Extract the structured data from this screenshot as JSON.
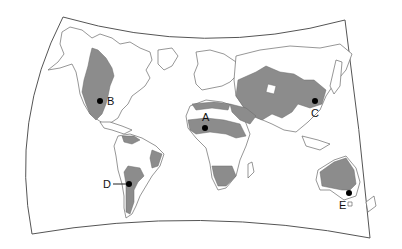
{
  "map": {
    "title": "",
    "projection": "world-map",
    "shading": {
      "meaning": "highlighted climate/biome regions",
      "fill_color": "#8c8c8c",
      "land_color": "#ffffff",
      "outline_color": "#6a6a6a"
    },
    "markers": [
      {
        "id": "A",
        "label": "A",
        "location": "Sahel, North Africa"
      },
      {
        "id": "B",
        "label": "B",
        "location": "Great Plains, North America"
      },
      {
        "id": "C",
        "label": "C",
        "location": "Northern China"
      },
      {
        "id": "D",
        "label": "D",
        "location": "Central Chile / Argentina"
      },
      {
        "id": "E",
        "label": "E",
        "location": "Southeastern Australia"
      }
    ]
  }
}
